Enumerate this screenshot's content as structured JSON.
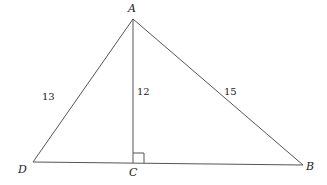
{
  "diagram": {
    "vertices": {
      "A": "A",
      "B": "B",
      "C": "C",
      "D": "D"
    },
    "lengths": {
      "AD": "13",
      "AC": "12",
      "AB": "15"
    },
    "right_angle_at": "C",
    "stroke_color": "#555555"
  }
}
